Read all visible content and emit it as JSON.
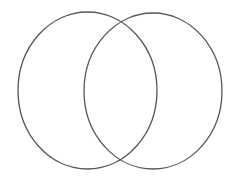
{
  "diagram": {
    "type": "venn",
    "background": "#ffffff",
    "stroke_color": "#555555",
    "stroke_width": 1.3,
    "sets": [
      {
        "name": "left-set",
        "cx": 87.5,
        "cy": 90.5,
        "rx": 69.5,
        "ry": 78.5,
        "label": ""
      },
      {
        "name": "right-set",
        "cx": 153,
        "cy": 91,
        "rx": 69,
        "ry": 78,
        "label": ""
      }
    ]
  }
}
